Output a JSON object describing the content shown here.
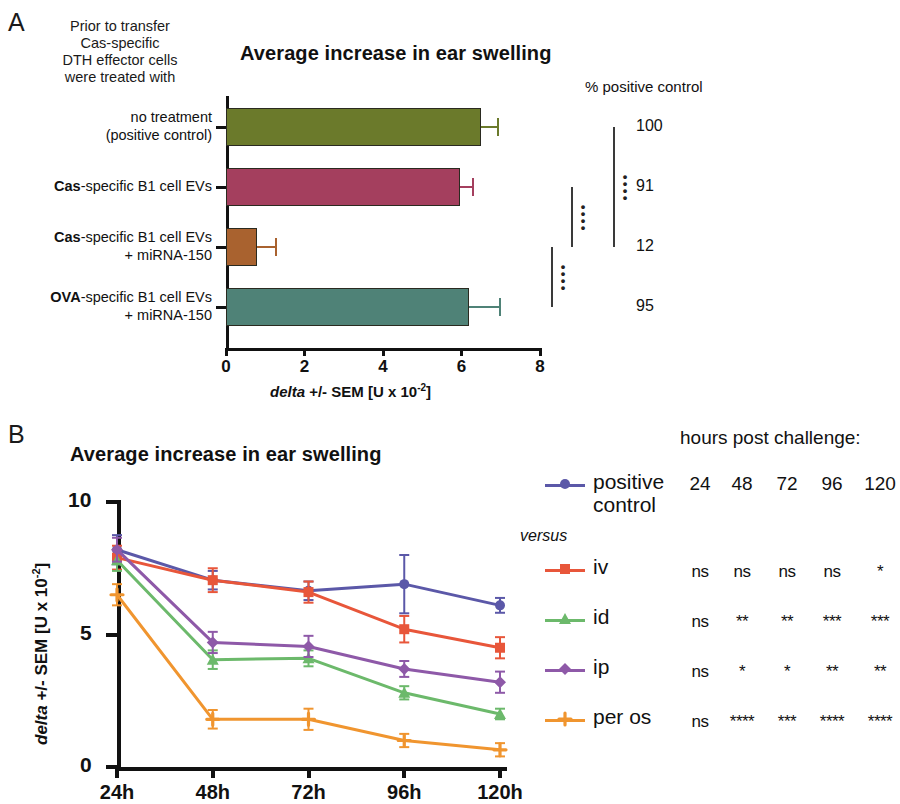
{
  "panelA": {
    "letter": "A",
    "title": "Average increase in ear swelling",
    "caption_lines": [
      "Prior to transfer",
      "Cas-specific",
      "DTH effector cells",
      "were treated with"
    ],
    "pct_header": "% positive control",
    "xlabel_html": "delta +/- SEM [U x 10-2]",
    "xticks": [
      "0",
      "2",
      "4",
      "6",
      "8"
    ],
    "xlim": [
      0,
      8
    ],
    "bars": [
      {
        "label_line1": "no treatment",
        "label_line2": "(positive control)",
        "bold_prefix": "",
        "value": 6.5,
        "sem": 0.42,
        "color": "#6b7a2b",
        "pct": "100"
      },
      {
        "label_line1": "Cas-specific B1 cell EVs",
        "label_line2": "",
        "bold_prefix": "Cas",
        "value": 5.95,
        "sem": 0.35,
        "color": "#a43f5e",
        "pct": "91"
      },
      {
        "label_line1": "Cas-specific B1 cell EVs",
        "label_line2": "+ miRNA-150",
        "bold_prefix": "Cas",
        "value": 0.78,
        "sem": 0.5,
        "color": "#a9622f",
        "pct": "12"
      },
      {
        "label_line1": "OVA-specific B1 cell EVs",
        "label_line2": "+ miRNA-150",
        "bold_prefix": "OVA",
        "value": 6.2,
        "sem": 0.78,
        "color": "#4f8277",
        "pct": "95"
      }
    ],
    "significance": [
      {
        "from": 0,
        "to": 2,
        "stars": "****"
      },
      {
        "from": 1,
        "to": 2,
        "stars": "****"
      },
      {
        "from": 2,
        "to": 3,
        "stars": "****"
      }
    ]
  },
  "panelB": {
    "letter": "B",
    "title": "Average increase in ear swelling",
    "ylabel_html": "delta +/- SEM [U x 10-2]",
    "yticks": [
      "0",
      "5",
      "10"
    ],
    "ylim": [
      0,
      10
    ],
    "xcats": [
      "24h",
      "48h",
      "72h",
      "96h",
      "120h"
    ],
    "legend_versus": "versus",
    "hours_header": "hours post challenge:",
    "hours_cols": [
      "24",
      "48",
      "72",
      "96",
      "120"
    ],
    "series": [
      {
        "name": "positive control",
        "color": "#5b58a8",
        "marker": "circle",
        "values": [
          8.2,
          7.05,
          6.65,
          6.9,
          6.1
        ],
        "errors": [
          0.55,
          0.35,
          0.35,
          1.1,
          0.28
        ]
      },
      {
        "name": "iv",
        "color": "#e8563a",
        "marker": "square",
        "values": [
          7.9,
          7.05,
          6.6,
          5.2,
          4.5
        ],
        "errors": [
          0.45,
          0.45,
          0.4,
          0.5,
          0.4
        ]
      },
      {
        "name": "id",
        "color": "#6cb96b",
        "marker": "triangle",
        "values": [
          7.8,
          4.05,
          4.1,
          2.8,
          2.0
        ],
        "errors": [
          0.4,
          0.35,
          0.3,
          0.25,
          0.2
        ]
      },
      {
        "name": "ip",
        "color": "#8e59a8",
        "marker": "diamond",
        "values": [
          8.2,
          4.7,
          4.55,
          3.7,
          3.2
        ],
        "errors": [
          0.45,
          0.4,
          0.4,
          0.3,
          0.4
        ]
      },
      {
        "name": "per os",
        "color": "#f0952f",
        "marker": "plus",
        "values": [
          6.5,
          1.8,
          1.8,
          1.0,
          0.65
        ],
        "errors": [
          0.4,
          0.35,
          0.4,
          0.25,
          0.25
        ]
      }
    ],
    "stats_rows": [
      {
        "name": "iv",
        "cells": [
          "ns",
          "ns",
          "ns",
          "ns",
          "*"
        ]
      },
      {
        "name": "id",
        "cells": [
          "ns",
          "**",
          "**",
          "***",
          "***"
        ]
      },
      {
        "name": "ip",
        "cells": [
          "ns",
          "*",
          "*",
          "**",
          "**"
        ]
      },
      {
        "name": "per os",
        "cells": [
          "ns",
          "****",
          "***",
          "****",
          "****"
        ]
      }
    ]
  }
}
